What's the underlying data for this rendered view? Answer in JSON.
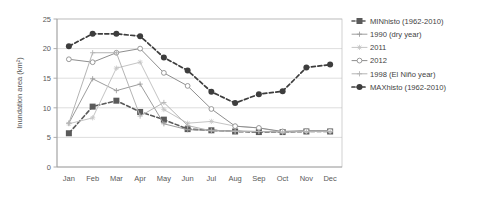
{
  "chart_data": {
    "type": "line",
    "title": "",
    "xlabel": "",
    "ylabel": "Inundation area (km²)",
    "categories": [
      "Jan",
      "Feb",
      "Mar",
      "Apr",
      "May",
      "Jun",
      "Jul",
      "Aug",
      "Sep",
      "Oct",
      "Nov",
      "Dec"
    ],
    "ylim": [
      0,
      25
    ],
    "yticks": [
      0,
      5,
      10,
      15,
      20,
      25
    ],
    "ytick_labels": [
      "0",
      "5",
      "10",
      "15",
      "20",
      "25"
    ],
    "grid": "horizontal",
    "legend_position": "right",
    "series": [
      {
        "name": "MINhisto (1962-2010)",
        "color": "#5a5a5a",
        "dash": "4,2.5",
        "width": 1.6,
        "marker": "square",
        "marker_size": 3.0,
        "values": [
          5.7,
          10.2,
          11.2,
          9.3,
          8.0,
          6.4,
          6.2,
          6.0,
          5.9,
          5.9,
          6.0,
          6.0
        ]
      },
      {
        "name": "1990 (dry year)",
        "color": "#9d9d9d",
        "dash": "none",
        "width": 1.0,
        "marker": "plus",
        "marker_size": 2.6,
        "values": [
          7.4,
          14.9,
          12.9,
          14.0,
          7.3,
          6.3,
          6.2,
          6.1,
          6.0,
          6.0,
          6.1,
          6.1
        ]
      },
      {
        "name": "2011",
        "color": "#c4c4c4",
        "dash": "none",
        "width": 1.0,
        "marker": "asterisk",
        "marker_size": 2.6,
        "values": [
          7.3,
          8.3,
          16.7,
          17.7,
          9.7,
          7.4,
          7.7,
          6.9,
          6.6,
          5.9,
          6.1,
          6.1
        ]
      },
      {
        "name": "2012",
        "color": "#8e8e8e",
        "dash": "none",
        "width": 1.0,
        "marker": "circle-open",
        "marker_size": 2.4,
        "values": [
          18.2,
          17.7,
          19.3,
          20.0,
          15.9,
          13.7,
          9.8,
          6.9,
          6.6,
          6.0,
          6.1,
          6.1
        ]
      },
      {
        "name": "1998 (El Niño year)",
        "color": "#b4b4b4",
        "dash": "none",
        "width": 1.0,
        "marker": "plus",
        "marker_size": 2.6,
        "values": [
          7.4,
          19.3,
          19.3,
          8.6,
          10.9,
          7.0,
          6.1,
          6.0,
          6.0,
          5.9,
          6.0,
          6.0
        ]
      },
      {
        "name": "MAXhisto (1962-2010)",
        "color": "#3d3d3d",
        "dash": "4,2.5",
        "width": 1.7,
        "marker": "circle",
        "marker_size": 3.0,
        "values": [
          20.4,
          22.5,
          22.5,
          22.1,
          18.5,
          16.3,
          12.7,
          10.8,
          12.3,
          12.8,
          16.8,
          17.3
        ]
      }
    ]
  },
  "figure": {
    "plot": {
      "left": 57,
      "top": 19,
      "width": 285,
      "height": 148
    },
    "legend": {
      "x": 352,
      "y": 21,
      "row_height": 13.2,
      "swatch_length": 15
    }
  }
}
